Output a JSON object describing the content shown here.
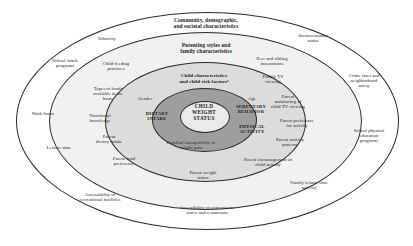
{
  "diagram": {
    "type": "nested-ellipse-ecological-model",
    "rings": [
      {
        "id": "ring-1",
        "label": "Community, demographic,\nand societal characteristics",
        "fill": "#ffffff"
      },
      {
        "id": "ring-2",
        "label": "Parenting styles and\nfamily characteristics",
        "fill": "#f1f1f1"
      },
      {
        "id": "ring-3",
        "label": "Child characteristics\nand child risk factorsᵃ",
        "fill": "#dcdcdc"
      },
      {
        "id": "ring-4",
        "label": "",
        "fill": "#9e9e9e"
      },
      {
        "id": "ring-5",
        "label": "CHILD\nWEIGHT\nSTATUS",
        "fill": "#e9e9e9"
      }
    ],
    "core_label": "CHILD\nWEIGHT\nSTATUS",
    "ring_headings": {
      "outer": "Community, demographic,\nand societal characteristics",
      "second": "Parenting styles and\nfamily characteristics",
      "third": "Child characteristics\nand child risk factorsᵃ"
    },
    "inner_domains": [
      {
        "name": "dietary-intake",
        "label": "DIETARY\nINTAKE"
      },
      {
        "name": "sedentary-behavior",
        "label": "SEDENTARY\nBEHAVIOR"
      },
      {
        "name": "physical-activity",
        "label": "PHYSICAL\nACTIVITY"
      }
    ],
    "child_factors": [
      {
        "name": "gender",
        "label": "Gender"
      },
      {
        "name": "age",
        "label": "Age"
      },
      {
        "name": "familial-susceptibility",
        "label": "Familial susceptibility to\nweight gain",
        "italic": true
      }
    ],
    "family_factors": [
      {
        "name": "child-feeding-practices",
        "label": "Child feeding\npractices"
      },
      {
        "name": "types-of-foods-available",
        "label": "Types of foods\navailable in the\nhome"
      },
      {
        "name": "nutritional-knowledge",
        "label": "Nutritional\nknowledge"
      },
      {
        "name": "parent-dietary-intake",
        "label": "Parent\ndietary intake"
      },
      {
        "name": "parent-food-preference",
        "label": "Parent food\npreference"
      },
      {
        "name": "parent-weight-status",
        "label": "Parent weight\nstatus"
      },
      {
        "name": "peer-and-sibling-interactions",
        "label": "Peer and sibling\ninteractions"
      },
      {
        "name": "family-tv-viewing",
        "label": "Family TV\nviewing"
      },
      {
        "name": "parent-monitoring-tv",
        "label": "Parent\nmonitoring of\nchild TV viewing"
      },
      {
        "name": "parent-preference-activity",
        "label": "Parent preference\nfor activity"
      },
      {
        "name": "parent-activity-patterns",
        "label": "Parent activity\npatterns"
      },
      {
        "name": "parent-encouragement-activity",
        "label": "Parent encouragement of\nchild activity"
      },
      {
        "name": "family-leisure-time-activity",
        "label": "Family leisure time\nactivity"
      }
    ],
    "community_factors": [
      {
        "name": "ethnicity",
        "label": "Ethnicity"
      },
      {
        "name": "school-lunch-programs",
        "label": "School lunch\nprograms"
      },
      {
        "name": "work-hours",
        "label": "Work hours"
      },
      {
        "name": "leisure-time",
        "label": "Leisure time"
      },
      {
        "name": "accessibility-recreational",
        "label": "Accessibility of\nrecreational facilities"
      },
      {
        "name": "accessibility-convenience-stores",
        "label": "Accessibility of convenience\nstores and restaurants"
      },
      {
        "name": "socioeconomic-status",
        "label": "Socioeconomic\nstatus"
      },
      {
        "name": "crime-rates-safety",
        "label": "Crime rates and\nneighborhood\nsafety"
      },
      {
        "name": "school-physical-education",
        "label": "School physical\neducation\nprograms"
      }
    ]
  }
}
